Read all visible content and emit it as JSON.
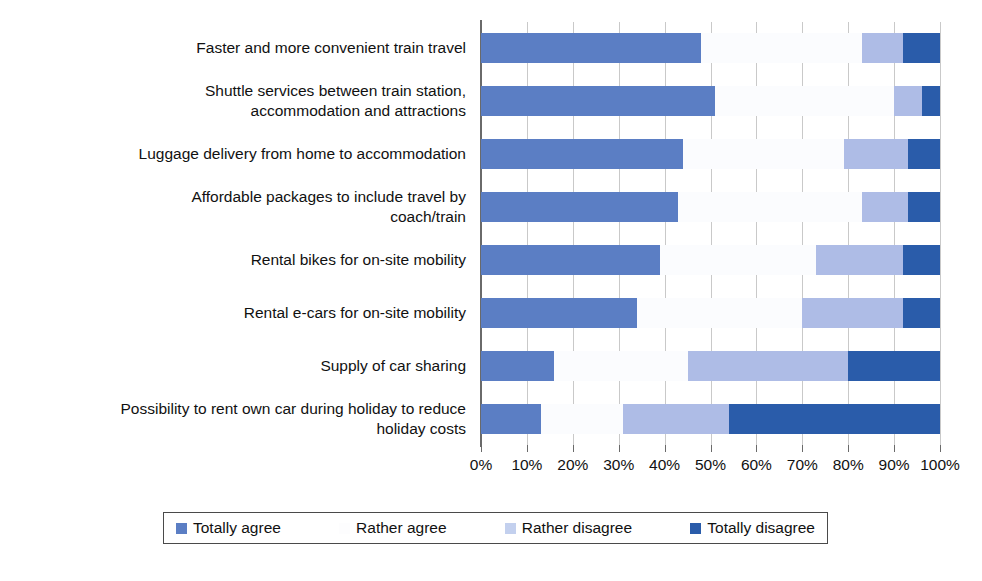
{
  "chart_data": {
    "type": "bar",
    "subtype": "stacked-horizontal-100pct",
    "title": "",
    "subtitle": "",
    "xlabel": "",
    "ylabel": "",
    "xlim": [
      0,
      100
    ],
    "xticks": [
      "0%",
      "10%",
      "20%",
      "30%",
      "40%",
      "50%",
      "60%",
      "70%",
      "80%",
      "90%",
      "100%"
    ],
    "xtick_values": [
      0,
      10,
      20,
      30,
      40,
      50,
      60,
      70,
      80,
      90,
      100
    ],
    "grid": true,
    "grid_axis": "x",
    "legend_position": "bottom",
    "categories": [
      "Faster and more convenient train travel",
      "Shuttle services between train station,\naccommodation and attractions",
      "Luggage delivery from home to accommodation",
      "Affordable packages to include travel by\ncoach/train",
      "Rental bikes for on-site mobility",
      "Rental e-cars for on-site mobility",
      "Supply of car sharing",
      "Possibility to rent own car during holiday to reduce\nholiday costs"
    ],
    "series": [
      {
        "name": "Totally agree",
        "color": "#5b7ec4",
        "values": [
          48,
          51,
          44,
          43,
          39,
          34,
          16,
          13
        ]
      },
      {
        "name": "Rather agree",
        "color": "#fbfcfe",
        "values": [
          35,
          39,
          35,
          40,
          34,
          36,
          29,
          18
        ]
      },
      {
        "name": "Rather disagree",
        "color": "#aebce6",
        "values": [
          9,
          6,
          14,
          10,
          19,
          22,
          35,
          23
        ]
      },
      {
        "name": "Totally disagree",
        "color": "#2a5caa",
        "values": [
          8,
          4,
          7,
          7,
          8,
          8,
          20,
          46
        ]
      }
    ]
  },
  "legend": {
    "items": [
      {
        "label": "Totally agree",
        "color": "#5b7ec4"
      },
      {
        "label": "Rather agree",
        "color": "#fdfdfe"
      },
      {
        "label": "Rather disagree",
        "color": "#c3d0ee"
      },
      {
        "label": "Totally disagree",
        "color": "#2a5caa"
      }
    ]
  },
  "colors": {
    "axis": "#6a6a6a",
    "grid": "#c9c9c9",
    "text": "#111111",
    "background": "#ffffff"
  }
}
